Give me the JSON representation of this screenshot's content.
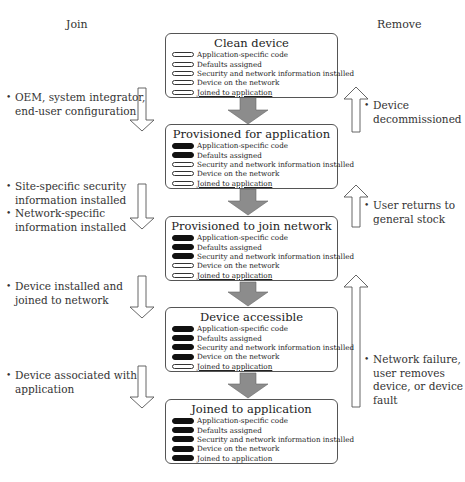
{
  "headings": {
    "join": "Join",
    "remove": "Remove"
  },
  "states": [
    {
      "title": "Clean device",
      "attributes": [
        {
          "label": "Application-specific code",
          "filled": false
        },
        {
          "label": "Defaults assigned",
          "filled": false
        },
        {
          "label": "Security and network information installed",
          "filled": false
        },
        {
          "label": "Device on the network",
          "filled": false
        },
        {
          "label": "Joined to application",
          "filled": false
        }
      ]
    },
    {
      "title": "Provisioned for application",
      "attributes": [
        {
          "label": "Application-specific code",
          "filled": true
        },
        {
          "label": "Defaults assigned",
          "filled": true
        },
        {
          "label": "Security and network information installed",
          "filled": false
        },
        {
          "label": "Device on the network",
          "filled": false
        },
        {
          "label": "Joined to application",
          "filled": false
        }
      ]
    },
    {
      "title": "Provisioned to join network",
      "attributes": [
        {
          "label": "Application-specific code",
          "filled": true
        },
        {
          "label": "Defaults assigned",
          "filled": true
        },
        {
          "label": "Security and network information installed",
          "filled": true
        },
        {
          "label": "Device on the network",
          "filled": false
        },
        {
          "label": "Joined to application",
          "filled": false
        }
      ]
    },
    {
      "title": "Device accessible",
      "attributes": [
        {
          "label": "Application-specific code",
          "filled": true
        },
        {
          "label": "Defaults assigned",
          "filled": true
        },
        {
          "label": "Security and network information installed",
          "filled": true
        },
        {
          "label": "Device on the network",
          "filled": true
        },
        {
          "label": "Joined to application",
          "filled": false
        }
      ]
    },
    {
      "title": "Joined to application",
      "attributes": [
        {
          "label": "Application-specific code",
          "filled": true
        },
        {
          "label": "Defaults assigned",
          "filled": true
        },
        {
          "label": "Security and network information installed",
          "filled": true
        },
        {
          "label": "Device on the network",
          "filled": true
        },
        {
          "label": "Joined to application",
          "filled": true
        }
      ]
    }
  ],
  "join_annotations": [
    {
      "items": [
        "OEM, system integrator,\nend-user configuration"
      ]
    },
    {
      "items": [
        "Site-specific security\ninformation installed",
        "Network-specific\ninformation installed"
      ]
    },
    {
      "items": [
        "Device installed and\njoined to network"
      ]
    },
    {
      "items": [
        "Device associated with\napplication"
      ]
    }
  ],
  "remove_annotations": [
    {
      "items": [
        "Device\ndecommissioned"
      ]
    },
    {
      "items": [
        "User returns to\ngeneral stock"
      ]
    },
    {
      "items": [
        "Network failure,\nuser removes\ndevice, or device\nfault"
      ]
    }
  ],
  "colors": {
    "flow_arrow_fill": "#8c8c8c",
    "outline_arrow_stroke": "#555555",
    "filled_pill": "#111111"
  }
}
